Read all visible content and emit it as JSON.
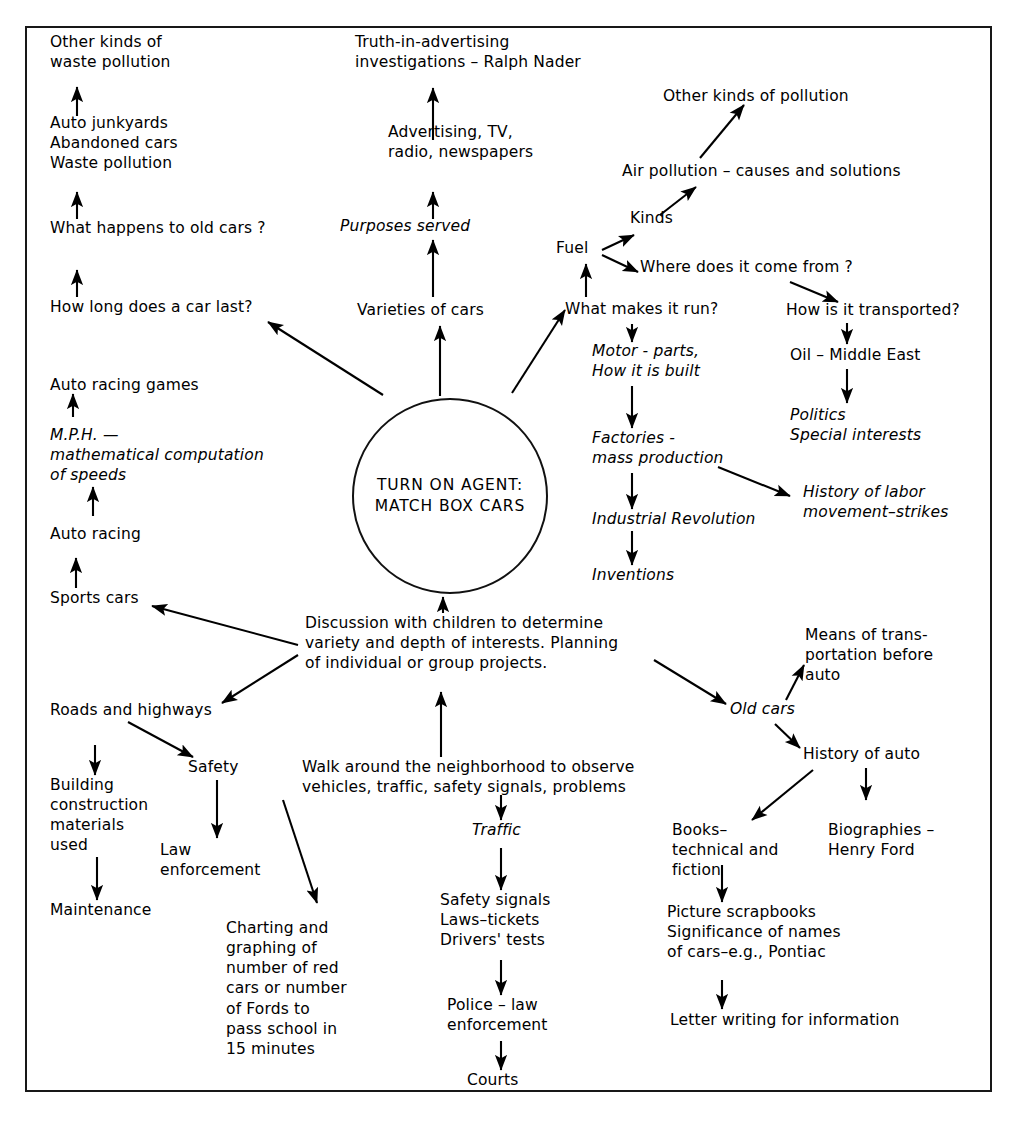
{
  "diagram": {
    "kind": "hand-drawn concept web / curriculum planning map",
    "center": {
      "line1": "TURN ON AGENT:",
      "line2": "MATCH BOX CARS",
      "full": "TURN ON AGENT:\nMATCH BOX CARS"
    },
    "nodes": {
      "other_kinds_waste_pollution": "Other kinds of\nwaste pollution",
      "auto_junkyards": "Auto junkyards\nAbandoned cars\nWaste pollution",
      "what_happens_old_cars": "What happens to old cars ?",
      "how_long_car_last": "How long does a car last?",
      "auto_racing_games": "Auto racing games",
      "mph_math": "M.P.H. —\nmathematical computation\nof speeds",
      "auto_racing": "Auto racing",
      "sports_cars": "Sports cars",
      "roads_and_highways": "Roads  and  highways",
      "building_construction": "Building\nconstruction\nmaterials\nused",
      "maintenance": "Maintenance",
      "safety": "Safety",
      "law_enforcement": "Law\nenforcement",
      "truth_in_advertising": "Truth-in-advertising\ninvestigations – Ralph Nader",
      "advertising_tv": "Advertising, TV,\nradio, newspapers",
      "purposes_served": "Purposes  served",
      "varieties_of_cars": "Varieties of cars",
      "discussion_with_children": "Discussion with children to determine\nvariety and depth of interests.  Planning\nof individual or group projects.",
      "walk_around": "Walk around the neighborhood to observe\nvehicles, traffic, safety signals, problems",
      "traffic": "Traffic",
      "safety_signals": "Safety signals\nLaws–tickets\nDrivers' tests",
      "police_law_enforcement": "Police – law\nenforcement",
      "courts": "Courts",
      "charting_graphing": "Charting and\ngraphing of\nnumber of red\ncars or number\nof Fords to\npass school in\n15 minutes",
      "other_kinds_pollution": "Other kinds of pollution",
      "air_pollution": "Air pollution – causes and solutions",
      "kinds": "Kinds",
      "fuel": "Fuel",
      "where_come_from": "Where does it come from ?",
      "what_makes_it_run": "What makes it run?",
      "how_transported": "How is it transported?",
      "oil_middle_east": "Oil – Middle East",
      "politics": "Politics\nSpecial interests",
      "motor_parts": "Motor - parts,\nHow it is built",
      "factories": "Factories -\nmass production",
      "industrial_revolution": "Industrial Revolution",
      "inventions": "Inventions",
      "history_of_labor": "History of labor\nmovement–strikes",
      "means_of_transportation": "Means of trans-\nportation before\nauto",
      "old_cars": "Old cars",
      "history_of_auto": "History of auto",
      "books_technical": "Books–\ntechnical and\nfiction",
      "biographies": "Biographies –\nHenry Ford",
      "picture_scrapbooks": "Picture scrapbooks\nSignificance of names\nof cars–e.g., Pontiac",
      "letter_writing": "Letter writing for information"
    },
    "colors": {
      "ink": "#000000",
      "paper": "#ffffff",
      "border": "#181818"
    }
  }
}
